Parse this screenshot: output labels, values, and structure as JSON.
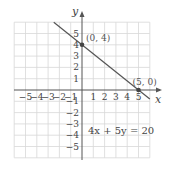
{
  "chart_data": {
    "type": "line",
    "title": "",
    "xlabel": "x",
    "ylabel": "y",
    "xlim": [
      -6,
      6
    ],
    "ylim": [
      -6,
      6
    ],
    "grid": true,
    "x_ticks": [
      "-5",
      "-4",
      "-3",
      "-2",
      "-1",
      "1",
      "2",
      "3",
      "4",
      "5"
    ],
    "y_ticks": [
      "5",
      "4",
      "3",
      "2",
      "1",
      "-1",
      "-2",
      "-3",
      "-4",
      "-5"
    ],
    "series": [
      {
        "name": "4x + 5y = 20",
        "equation": "4x + 5y = 20",
        "x": [
          -2.5,
          6
        ],
        "y": [
          6,
          -0.8
        ]
      }
    ],
    "points": [
      {
        "x": 0,
        "y": 4,
        "label": "(0, 4)"
      },
      {
        "x": 5,
        "y": 0,
        "label": "(5, 0)"
      }
    ],
    "annotations": [
      {
        "text": "4x + 5y = 20",
        "x": 1.5,
        "y": -3.5
      }
    ],
    "colors": {
      "line": "#555555",
      "point": "#444444",
      "grid": "#d8d8d8"
    }
  }
}
